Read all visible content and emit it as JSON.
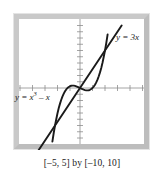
{
  "figure": {
    "caption": "[–5, 5] by [–10, 10]",
    "frame_color": "#c9c9c9",
    "curve_color": "#1a1a1a",
    "axis_color": "#8d8d8d",
    "background": "#ffffff"
  },
  "labels": {
    "line": {
      "lhs": "y = 3",
      "var": "x"
    },
    "cubic": {
      "lhs": "y = ",
      "base": "x",
      "exponent": "3",
      "operator": " – ",
      "tail": "x"
    }
  },
  "chart_data": {
    "type": "line",
    "title": "",
    "subtitle": "",
    "xlabel": "",
    "ylabel": "",
    "xlim": [
      -5,
      5
    ],
    "ylim": [
      -10,
      10
    ],
    "xtick_step": 1,
    "ytick_step": 1,
    "grid": false,
    "legend": "inline-annotations",
    "annotations": [
      {
        "text": "y = 3x",
        "x": 2.7,
        "y": 7.3
      },
      {
        "text": "y = x³ – x",
        "x": -4.3,
        "y": -1.4
      }
    ],
    "series": [
      {
        "name": "y = x^3 - x",
        "expression": "x**3 - x",
        "color": "#1a1a1a",
        "x": [
          -2.21,
          -2.1,
          -2.0,
          -1.9,
          -1.8,
          -1.7,
          -1.6,
          -1.5,
          -1.4,
          -1.3,
          -1.2,
          -1.1,
          -1.0,
          -0.9,
          -0.8,
          -0.7,
          -0.6,
          -0.5,
          -0.4,
          -0.3,
          -0.2,
          -0.1,
          0.0,
          0.1,
          0.2,
          0.3,
          0.4,
          0.5,
          0.6,
          0.7,
          0.8,
          0.9,
          1.0,
          1.1,
          1.2,
          1.3,
          1.4,
          1.5,
          1.6,
          1.7,
          1.8,
          1.9,
          2.0,
          2.1,
          2.21
        ],
        "y": [
          -8.58,
          -7.16,
          -6.0,
          -5.0,
          -4.03,
          -3.21,
          -2.5,
          -1.88,
          -1.34,
          -0.9,
          -0.53,
          -0.23,
          0.0,
          0.17,
          0.29,
          0.36,
          0.38,
          0.38,
          0.34,
          0.27,
          0.19,
          0.099,
          0.0,
          -0.099,
          -0.19,
          -0.27,
          -0.34,
          -0.38,
          -0.38,
          -0.36,
          -0.29,
          -0.17,
          0.0,
          0.23,
          0.53,
          0.9,
          1.34,
          1.88,
          2.5,
          3.21,
          4.03,
          5.0,
          6.0,
          7.16,
          8.58
        ]
      },
      {
        "name": "y = 3x",
        "expression": "3*x",
        "color": "#1a1a1a",
        "x": [
          -3.33,
          0,
          3.33
        ],
        "y": [
          -10,
          0,
          10
        ]
      }
    ],
    "intersections": [
      {
        "x": -2.0,
        "y": -6.0
      },
      {
        "x": 0.0,
        "y": 0.0
      },
      {
        "x": 2.0,
        "y": 6.0
      }
    ]
  }
}
